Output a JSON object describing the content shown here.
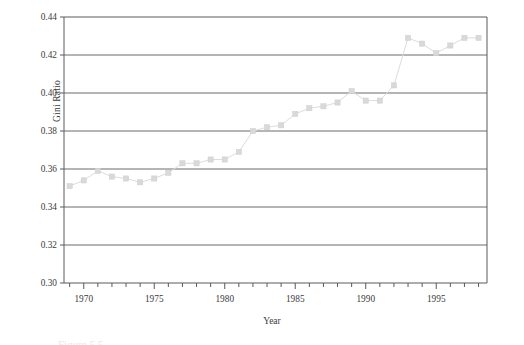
{
  "figure": {
    "caption_fragment": "Figure 5.5"
  },
  "axis": {
    "y_title": "Gini Ratio",
    "x_title": "Year",
    "y_ticks": [
      "0.30",
      "0.32",
      "0.34",
      "0.36",
      "0.38",
      "0.40",
      "0.42",
      "0.44"
    ],
    "x_ticks": [
      "1970",
      "1975",
      "1980",
      "1985",
      "1990",
      "1995"
    ]
  },
  "chart_data": {
    "type": "line",
    "title": "",
    "xlabel": "Year",
    "ylabel": "Gini Ratio",
    "xlim": [
      1968.6,
      1998.6
    ],
    "ylim": [
      0.3,
      0.44
    ],
    "ytick_step": 0.02,
    "xtick_step": 1,
    "xtick_labeled_step": 5,
    "grid": "horizontal",
    "legend": "none",
    "marker": "square",
    "marker_color": "#d9d9d9",
    "line_color": "#dcdcdc",
    "axis_color": "#5a5a5a",
    "x": [
      1969,
      1970,
      1971,
      1972,
      1973,
      1974,
      1975,
      1976,
      1977,
      1978,
      1979,
      1980,
      1981,
      1982,
      1983,
      1984,
      1985,
      1986,
      1987,
      1988,
      1989,
      1990,
      1991,
      1992,
      1993,
      1994,
      1995,
      1996,
      1997,
      1998
    ],
    "values": [
      0.351,
      0.354,
      0.359,
      0.356,
      0.355,
      0.353,
      0.355,
      0.358,
      0.363,
      0.363,
      0.365,
      0.365,
      0.369,
      0.38,
      0.382,
      0.383,
      0.389,
      0.392,
      0.393,
      0.395,
      0.401,
      0.396,
      0.396,
      0.404,
      0.429,
      0.426,
      0.421,
      0.425,
      0.429,
      0.429
    ]
  }
}
